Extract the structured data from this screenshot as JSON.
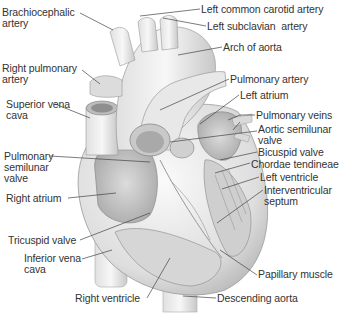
{
  "diagram": {
    "labels": [
      {
        "id": "brachiocephalic",
        "text": "Brachiocephalic\nartery",
        "x": 2,
        "y": 9
      },
      {
        "id": "left-common-carotid",
        "text": "Left common carotid artery",
        "x": 201,
        "y": 4
      },
      {
        "id": "left-subclavian",
        "text": "Left subclavian  artery",
        "x": 207,
        "y": 21
      },
      {
        "id": "arch-of-aorta",
        "text": "Arch of aorta",
        "x": 223,
        "y": 42
      },
      {
        "id": "right-pulmonary-artery",
        "text": "Right pulmonary\nartery",
        "x": 2,
        "y": 64
      },
      {
        "id": "pulmonary-artery",
        "text": "Pulmonary artery",
        "x": 230,
        "y": 74
      },
      {
        "id": "left-atrium",
        "text": "Left atrium",
        "x": 240,
        "y": 90
      },
      {
        "id": "superior-vena-cava",
        "text": "Superior vena\ncava",
        "x": 6,
        "y": 99
      },
      {
        "id": "pulmonary-veins",
        "text": "Pulmonary veins",
        "x": 256,
        "y": 110
      },
      {
        "id": "aortic-semilunar-valve",
        "text": "Aortic semilunar\nvalve",
        "x": 258,
        "y": 124
      },
      {
        "id": "bicuspid-valve",
        "text": "Bicuspid valve",
        "x": 258,
        "y": 147
      },
      {
        "id": "pulmonary-semilunar-valve",
        "text": "Pulmonary\nsemilunar\nvalve",
        "x": 4,
        "y": 150
      },
      {
        "id": "chordae-tendineae",
        "text": "Chordae tendineae",
        "x": 251,
        "y": 159
      },
      {
        "id": "left-ventricle",
        "text": "Left ventricle",
        "x": 260,
        "y": 172
      },
      {
        "id": "interventricular-septum",
        "text": "Interventricular\nseptum",
        "x": 264,
        "y": 185
      },
      {
        "id": "right-atrium",
        "text": "Right atrium",
        "x": 6,
        "y": 193
      },
      {
        "id": "tricuspid-valve",
        "text": "Tricuspid valve",
        "x": 8,
        "y": 235
      },
      {
        "id": "inferior-vena-cava",
        "text": "Inferior vena\ncava",
        "x": 24,
        "y": 252
      },
      {
        "id": "papillary-muscle",
        "text": "Papillary muscle",
        "x": 258,
        "y": 269
      },
      {
        "id": "descending-aorta",
        "text": "Descending aorta",
        "x": 217,
        "y": 293
      },
      {
        "id": "right-ventricle",
        "text": "Right ventricle",
        "x": 75,
        "y": 293
      }
    ],
    "colors": {
      "background": "#ffffff",
      "text": "#333333",
      "leader": "#444444",
      "tissue_light": "#f2f2f2",
      "tissue_mid": "#cfcfcf",
      "tissue_dark": "#9a9a9a"
    }
  }
}
